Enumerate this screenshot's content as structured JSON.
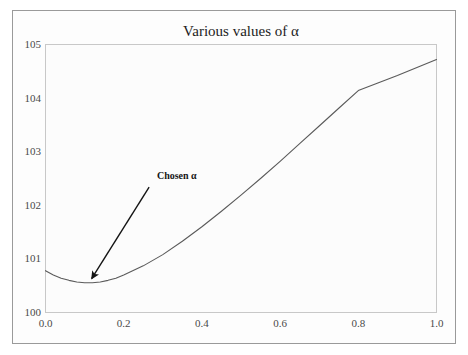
{
  "figure": {
    "background_color": "#ffffff",
    "frame_color": "#9a9a9a",
    "plot_background_color": "#fcfcfc",
    "plot_border_color": "#c8c8c8"
  },
  "chart_data": {
    "type": "line",
    "title": "Various values of α",
    "xlabel": "",
    "ylabel": "",
    "xlim": [
      0.0,
      1.0
    ],
    "ylim": [
      100,
      105
    ],
    "grid": false,
    "legend": null,
    "line_color": "#5a5a5a",
    "x_ticks": [
      "0.0",
      "0.2",
      "0.4",
      "0.6",
      "0.8",
      "1.0"
    ],
    "x_tick_values": [
      0.0,
      0.2,
      0.4,
      0.6,
      0.8,
      1.0
    ],
    "y_ticks": [
      "100",
      "101",
      "102",
      "103",
      "104",
      "105"
    ],
    "y_tick_values": [
      100,
      101,
      102,
      103,
      104,
      105
    ],
    "series": [
      {
        "name": "objective",
        "x": [
          0.0,
          0.02,
          0.04,
          0.06,
          0.08,
          0.1,
          0.12,
          0.14,
          0.16,
          0.18,
          0.2,
          0.25,
          0.3,
          0.35,
          0.4,
          0.45,
          0.5,
          0.55,
          0.6,
          0.65,
          0.7,
          0.75,
          0.8,
          0.85,
          0.9,
          0.95,
          1.0
        ],
        "y": [
          100.78,
          100.7,
          100.64,
          100.6,
          100.57,
          100.555,
          100.555,
          100.57,
          100.6,
          100.64,
          100.7,
          100.87,
          101.08,
          101.33,
          101.6,
          101.89,
          102.19,
          102.5,
          102.82,
          103.15,
          103.48,
          103.81,
          104.14,
          104.28,
          104.42,
          104.57,
          104.72
        ]
      }
    ],
    "annotations": [
      {
        "label": "Chosen α",
        "text_x": 0.285,
        "text_y": 102.49,
        "arrow_tail_x": 0.265,
        "arrow_tail_y": 102.34,
        "arrow_head_x": 0.118,
        "arrow_head_y": 100.63,
        "color": "#141414"
      }
    ]
  }
}
